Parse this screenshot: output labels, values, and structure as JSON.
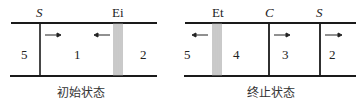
{
  "initial": {
    "caption": "初始状态",
    "labels": {
      "shock": "S",
      "expansion": "Ei"
    },
    "regions": [
      "5",
      "1",
      "2"
    ]
  },
  "final": {
    "caption": "终止状态",
    "labels": {
      "expansion": "Et",
      "contact": "C",
      "shock": "S"
    },
    "regions": [
      "5",
      "4",
      "3",
      "2"
    ]
  },
  "colors": {
    "line": "#1a1a1a",
    "fan": "#888888"
  }
}
